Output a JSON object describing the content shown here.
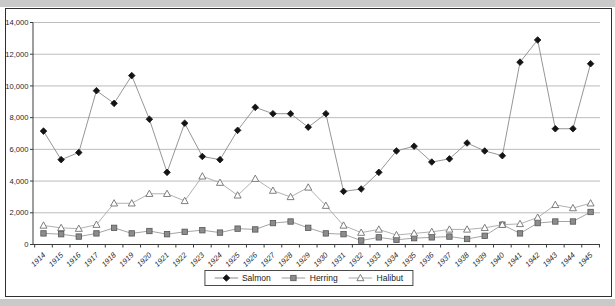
{
  "chart_data": {
    "type": "line",
    "title": "",
    "xlabel": "",
    "ylabel": "",
    "grid": "horizontal",
    "legend_position": "bottom-center",
    "ylim": [
      0,
      14000
    ],
    "ytick_step": 2000,
    "yticks": [
      {
        "value": 0,
        "label": "0"
      },
      {
        "value": 2000,
        "label": "2,000"
      },
      {
        "value": 4000,
        "label": "4,000"
      },
      {
        "value": 6000,
        "label": "6,000"
      },
      {
        "value": 8000,
        "label": "8,000"
      },
      {
        "value": 10000,
        "label": "10,000"
      },
      {
        "value": 12000,
        "label": "12,000"
      },
      {
        "value": 14000,
        "label": "14,000"
      }
    ],
    "categories": [
      "1914",
      "1915",
      "1916",
      "1917",
      "1918",
      "1919",
      "1920",
      "1921",
      "1922",
      "1923",
      "1924",
      "1925",
      "1926",
      "1927",
      "1928",
      "1929",
      "1930",
      "1931",
      "1932",
      "1933",
      "1934",
      "1935",
      "1936",
      "1937",
      "1938",
      "1939",
      "1940",
      "1941",
      "1942",
      "1943",
      "1944",
      "1945"
    ],
    "series": [
      {
        "name": "Salmon",
        "marker": "diamond",
        "marker_color": "#141414",
        "marker_edge": "#141414",
        "line_color": "#8a8a8a",
        "values": [
          7150,
          5350,
          5800,
          9700,
          8900,
          10650,
          7900,
          4550,
          7650,
          5550,
          5350,
          7200,
          8650,
          8250,
          8250,
          7400,
          8250,
          3350,
          3500,
          4550,
          5900,
          6200,
          5200,
          5400,
          6400,
          5900,
          5600,
          11500,
          12900,
          7300,
          7300,
          11400
        ]
      },
      {
        "name": "Herring",
        "marker": "square",
        "marker_color": "#8c8c8c",
        "marker_edge": "#565656",
        "line_color": "#9a9a9a",
        "values": [
          700,
          650,
          500,
          700,
          1050,
          700,
          850,
          650,
          800,
          900,
          750,
          1000,
          950,
          1350,
          1450,
          1050,
          700,
          650,
          250,
          450,
          300,
          400,
          450,
          500,
          350,
          550,
          1250,
          700,
          1350,
          1450,
          1450,
          2050
        ]
      },
      {
        "name": "Halibut",
        "marker": "triangle-open",
        "marker_color": "#ffffff",
        "marker_edge": "#707070",
        "line_color": "#a8a8a8",
        "values": [
          1200,
          1050,
          1000,
          1250,
          2600,
          2600,
          3200,
          3200,
          2750,
          4300,
          3900,
          3100,
          4150,
          3400,
          3000,
          3600,
          2450,
          1200,
          750,
          950,
          600,
          700,
          800,
          950,
          950,
          1050,
          1250,
          1300,
          1700,
          2500,
          2300,
          2600
        ]
      }
    ]
  },
  "colors": {
    "gridline": "#b4b4b4",
    "axis": "#3c3c3c",
    "tick_label": "#1f1f1f",
    "panel_border": "#2f2f2f",
    "edge_band": "#c9c9c9",
    "background": "#ffffff"
  }
}
